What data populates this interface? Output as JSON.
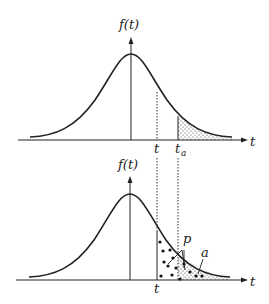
{
  "figure": {
    "top_panel": {
      "y_axis_label": "f(t)",
      "x_axis_label": "t",
      "tick_t": "t",
      "tick_ta_main": "t",
      "tick_ta_sub": "a",
      "shaded_region": "right tail beyond t_a (fine dotted)"
    },
    "bottom_panel": {
      "y_axis_label": "f(t)",
      "x_axis_label": "t",
      "tick_t": "t",
      "label_p": "p",
      "label_a": "a",
      "shaded_region_p": "right tail beyond t (large dots)",
      "shaded_region_a": "right tail beyond t_a (fine dotted)"
    },
    "colors": {
      "line": "#222222",
      "background": "#ffffff"
    }
  }
}
